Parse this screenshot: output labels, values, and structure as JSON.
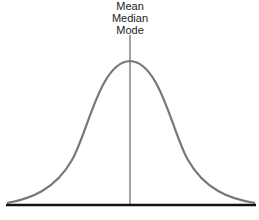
{
  "diagram": {
    "labels": {
      "line1": "Mean",
      "line2": "Median",
      "line3": "Mode"
    },
    "colors": {
      "curve": "#777777",
      "center_line": "#444444",
      "baseline": "#111111",
      "text": "#222222"
    },
    "geometry": {
      "peak_x": 130,
      "peak_y": 61,
      "baseline_y": 205,
      "left_x": 7,
      "right_x": 255
    }
  }
}
